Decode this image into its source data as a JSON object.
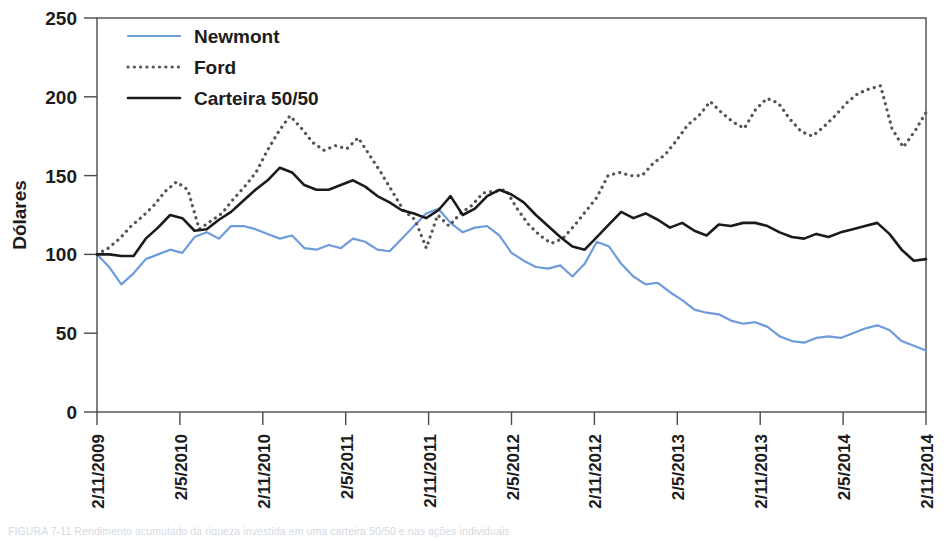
{
  "figure": {
    "type": "line-chart",
    "ylabel": "Dólares",
    "caption": "FIGURA 7-11 Rendimento acumulado da riqueza investida em uma carteira 50/50 e nas ações individuais"
  },
  "legend": {
    "position": "top-left-inside",
    "items": [
      {
        "label": "Newmont",
        "style": "solid",
        "color": "#6e9bdc",
        "width": 2.2
      },
      {
        "label": "Ford",
        "style": "dotted",
        "color": "#555555",
        "width": 2.6
      },
      {
        "label": "Carteira 50/50",
        "style": "solid",
        "color": "#1a1a1a",
        "width": 2.6
      }
    ]
  },
  "chart_data": {
    "type": "line",
    "title": "",
    "xlabel": "",
    "ylabel": "Dólares",
    "ylim": [
      0,
      250
    ],
    "yticks": [
      0,
      50,
      100,
      150,
      200,
      250
    ],
    "grid": false,
    "xtick_labels": [
      "2/11/2009",
      "2/5/2010",
      "2/11/2010",
      "2/5/2011",
      "2/11/2011",
      "2/5/2012",
      "2/11/2012",
      "2/5/2013",
      "2/11/2013",
      "2/5/2014",
      "2/11/2014"
    ],
    "x_start": "2/11/2009",
    "x_end": "2/11/2014",
    "x_interval": "monthly",
    "n_points": 62,
    "series": [
      {
        "name": "Newmont",
        "color": "#6e9bdc",
        "style": "solid",
        "values": [
          100,
          92,
          81,
          88,
          97,
          100,
          103,
          101,
          111,
          114,
          110,
          118,
          118,
          116,
          113,
          110,
          112,
          104,
          103,
          106,
          104,
          110,
          108,
          103,
          102,
          110,
          118,
          126,
          129,
          120,
          114,
          117,
          118,
          112,
          101,
          96,
          92,
          91,
          93,
          86,
          94,
          108,
          105,
          94,
          86,
          81,
          82,
          76,
          71,
          65,
          63,
          62,
          58,
          56,
          57,
          54,
          48,
          45,
          44,
          47,
          48,
          47,
          50,
          53,
          55,
          52,
          45,
          42,
          39
        ]
      },
      {
        "name": "Ford",
        "color": "#555555",
        "style": "dotted",
        "values": [
          100,
          104,
          110,
          118,
          124,
          131,
          140,
          146,
          141,
          116,
          121,
          126,
          135,
          143,
          152,
          166,
          178,
          188,
          180,
          171,
          166,
          169,
          167,
          174,
          163,
          152,
          140,
          128,
          122,
          104,
          125,
          118,
          126,
          131,
          139,
          140,
          141,
          129,
          119,
          112,
          107,
          110,
          118,
          127,
          136,
          150,
          152,
          150,
          150,
          158,
          163,
          172,
          182,
          188,
          197,
          190,
          184,
          180,
          192,
          199,
          196,
          186,
          178,
          175,
          181,
          188,
          196,
          202,
          205,
          207,
          180,
          168,
          178,
          190
        ]
      },
      {
        "name": "Carteira 50/50",
        "color": "#1a1a1a",
        "style": "solid",
        "values": [
          100,
          100,
          99,
          99,
          110,
          117,
          125,
          123,
          115,
          116,
          122,
          127,
          134,
          141,
          147,
          155,
          152,
          144,
          141,
          141,
          144,
          147,
          143,
          137,
          133,
          128,
          126,
          123,
          128,
          137,
          125,
          129,
          137,
          141,
          138,
          133,
          125,
          118,
          111,
          105,
          103,
          111,
          119,
          127,
          123,
          126,
          122,
          117,
          120,
          115,
          112,
          119,
          118,
          120,
          120,
          118,
          114,
          111,
          110,
          113,
          111,
          114,
          116,
          118,
          120,
          113,
          103,
          96,
          97
        ]
      }
    ]
  },
  "axes": {
    "y_tick_labels": [
      "250",
      "200",
      "150",
      "100",
      "50",
      "0"
    ]
  }
}
